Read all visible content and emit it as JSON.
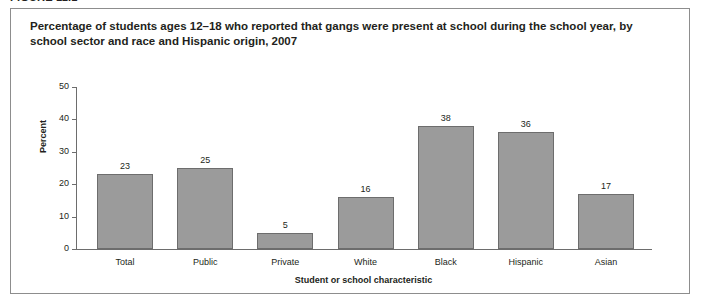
{
  "figure": {
    "label": "FIGURE 11.1"
  },
  "chart_data": {
    "type": "bar",
    "title": "Percentage of students ages 12–18 who reported that gangs were present at school during the school year, by school sector and race and Hispanic origin, 2007",
    "xlabel": "Student or school characteristic",
    "ylabel": "Percent",
    "categories": [
      "Total",
      "Public",
      "Private",
      "White",
      "Black",
      "Hispanic",
      "Asian"
    ],
    "values": [
      23,
      25,
      5,
      16,
      38,
      36,
      17
    ],
    "ylim": [
      0,
      50
    ],
    "yticks": [
      0,
      10,
      20,
      30,
      40,
      50
    ],
    "grid": false,
    "legend": false,
    "bar_color": "#9b9b9b",
    "bar_edge_color": "#6d6d6d",
    "axis_color": "#6d6d6d",
    "text_color": "#231f20",
    "panel_border_color": "#8d8d8d"
  }
}
